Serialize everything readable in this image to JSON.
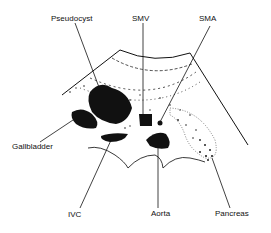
{
  "diagram": {
    "type": "anatomical-ultrasound-sketch",
    "labels": {
      "pseudocyst": "Pseudocyst",
      "smv": "SMV",
      "sma": "SMA",
      "gallbladder": "Gallbladder",
      "ivc": "IVC",
      "aorta": "Aorta",
      "pancreas": "Pancreas"
    },
    "colors": {
      "ink": "#111111",
      "background": "#ffffff"
    }
  }
}
